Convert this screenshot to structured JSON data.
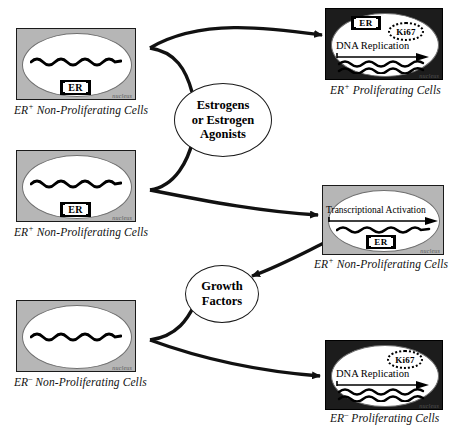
{
  "diagram": {
    "type": "flow-diagram",
    "colors": {
      "box_gray": "#b6b6b6",
      "box_dark": "#1c1c1c",
      "nucleus_white": "#ffffff",
      "stroke_black": "#111111",
      "chromatin_black": "#000000"
    }
  },
  "hubs": [
    {
      "id": "estrogens",
      "lines": [
        "Estrogens",
        "or Estrogen",
        "Agonists"
      ]
    },
    {
      "id": "growth-factors",
      "lines": [
        "Growth",
        "Factors"
      ]
    }
  ],
  "cells": [
    {
      "id": "er-pos-nonprolif-top",
      "style": "gray",
      "nucleus_label": "nucleus",
      "markers": [
        "ER"
      ],
      "caption_main": "Non-Proliferating Cells",
      "caption_symbol": "ER",
      "caption_sup": "+",
      "caption_full": "ER+ Non-Proliferating Cells"
    },
    {
      "id": "er-pos-nonprolif-mid",
      "style": "gray",
      "nucleus_label": "nucleus",
      "markers": [
        "ER"
      ],
      "caption_main": "Non-Proliferating Cells",
      "caption_symbol": "ER",
      "caption_sup": "+",
      "caption_full": "ER+ Non-Proliferating Cells"
    },
    {
      "id": "er-neg-nonprolif-bottom",
      "style": "gray",
      "nucleus_label": "nucleus",
      "markers": [],
      "caption_main": "Non-Proliferating Cells",
      "caption_symbol": "ER",
      "caption_sup": "–",
      "caption_full": "ER– Non-Proliferating Cells"
    },
    {
      "id": "er-pos-prolif",
      "style": "dark",
      "nucleus_label": "nucleus",
      "markers": [
        "ER",
        "Ki67"
      ],
      "process_label": "DNA Replication",
      "caption_main": "Proliferating Cells",
      "caption_symbol": "ER",
      "caption_sup": "+",
      "caption_full": "ER+ Proliferating Cells"
    },
    {
      "id": "transcriptional-activation",
      "style": "gray",
      "nucleus_label": "nucleus",
      "markers": [
        "ER"
      ],
      "process_label": "Transcriptional Activation",
      "caption_main": "Non-Proliferating Cells",
      "caption_symbol": "ER",
      "caption_sup": "+",
      "caption_full": "ER+ Non-Proliferating Cells"
    },
    {
      "id": "er-neg-prolif",
      "style": "dark",
      "nucleus_label": "nucleus",
      "markers": [
        "Ki67"
      ],
      "process_label": "DNA Replication",
      "caption_main": "Proliferating Cells",
      "caption_symbol": "ER",
      "caption_sup": "–",
      "caption_full": "ER– Proliferating Cells"
    }
  ],
  "labels": {
    "er": "ER",
    "ki67": "Ki67",
    "dna_replication": "DNA Replication",
    "transcriptional_activation": "Transcriptional Activation",
    "nucleus": "nucleus"
  }
}
